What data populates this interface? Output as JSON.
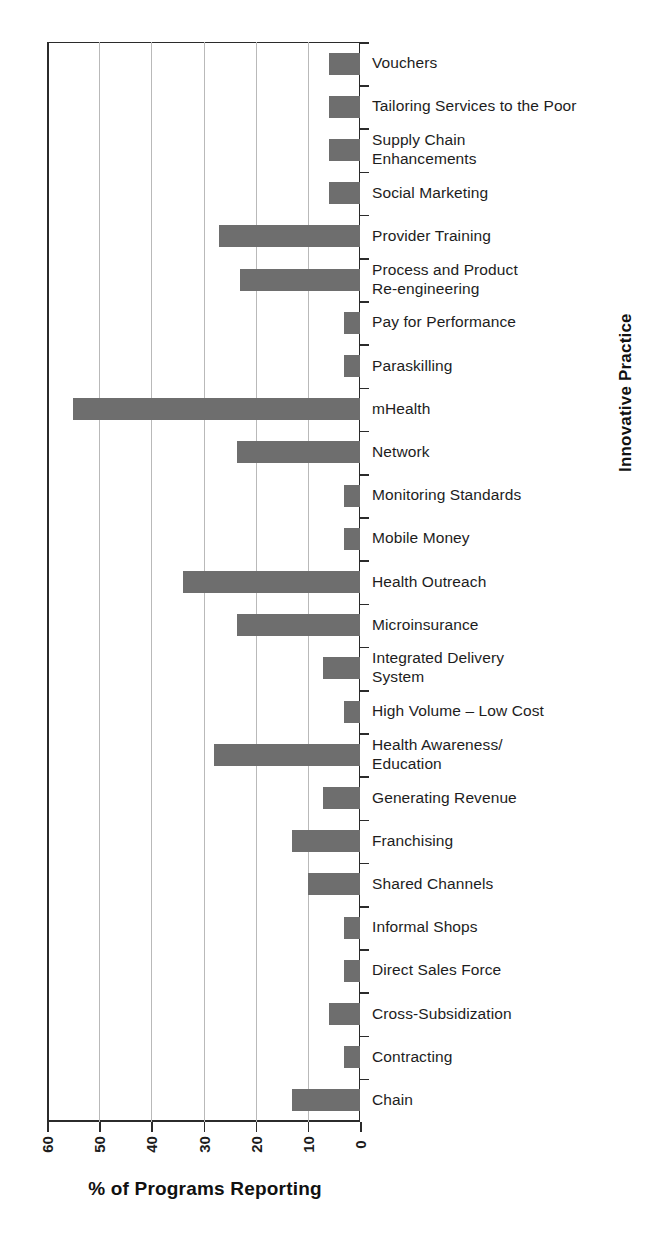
{
  "chart_data": {
    "type": "bar",
    "orientation": "horizontal",
    "title": "",
    "xlabel": "% of Programs Reporting",
    "ylabel": "Innovative Practice",
    "xlim": [
      60,
      0
    ],
    "x_axis_reversed": true,
    "xticks": [
      60,
      50,
      40,
      30,
      20,
      10,
      0
    ],
    "xticklabels": [
      "60",
      "50",
      "40",
      "30",
      "20",
      "10",
      "0"
    ],
    "grid": "vertical",
    "legend": "none",
    "bar_color": "#6e6e6e",
    "axis_color": "#2b2b2b",
    "gridline_color": "#b9b9b9",
    "categories": [
      "Vouchers",
      "Tailoring Services to the Poor",
      "Supply Chain\nEnhancements",
      "Social Marketing",
      "Provider Training",
      "Process and Product\nRe-engineering",
      "Pay for Performance",
      "Paraskilling",
      "mHealth",
      "Network",
      "Monitoring Standards",
      "Mobile Money",
      "Health Outreach",
      "Microinsurance",
      "Integrated Delivery\nSystem",
      "High Volume – Low Cost",
      "Health Awareness/\nEducation",
      "Generating Revenue",
      "Franchising",
      "Shared Channels",
      "Informal Shops",
      "Direct Sales Force",
      "Cross-Subsidization",
      "Contracting",
      "Chain"
    ],
    "values": [
      6,
      6,
      6,
      6,
      27,
      23,
      3,
      3,
      55,
      23.5,
      3,
      3,
      34,
      23.5,
      7,
      3,
      28,
      7,
      13,
      10,
      3,
      3,
      6,
      3,
      13
    ]
  }
}
